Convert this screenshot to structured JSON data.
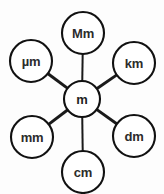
{
  "diagram": {
    "type": "hub-and-spoke",
    "background_color": "#fdfdfd",
    "stroke_color": "#111111",
    "node_fill_color": "#ffffff",
    "label_color": "#2b2b2b",
    "center": {
      "id": "m",
      "label": "m",
      "cx": 82,
      "cy": 99,
      "r": 18
    },
    "satellites": [
      {
        "id": "Mm",
        "label": "Mm",
        "cx": 83,
        "cy": 33,
        "r": 21,
        "spoke": "vertical"
      },
      {
        "id": "km",
        "label": "km",
        "cx": 134,
        "cy": 63,
        "r": 21,
        "spoke": "diagonal"
      },
      {
        "id": "dm",
        "label": "dm",
        "cx": 134,
        "cy": 136,
        "r": 21,
        "spoke": "diagonal"
      },
      {
        "id": "cm",
        "label": "cm",
        "cx": 83,
        "cy": 172,
        "r": 21,
        "spoke": "vertical"
      },
      {
        "id": "mm",
        "label": "mm",
        "cx": 32,
        "cy": 137,
        "r": 21,
        "spoke": "diagonal"
      },
      {
        "id": "um",
        "label": "µm",
        "cx": 31,
        "cy": 61,
        "r": 21,
        "spoke": "diagonal"
      }
    ]
  }
}
